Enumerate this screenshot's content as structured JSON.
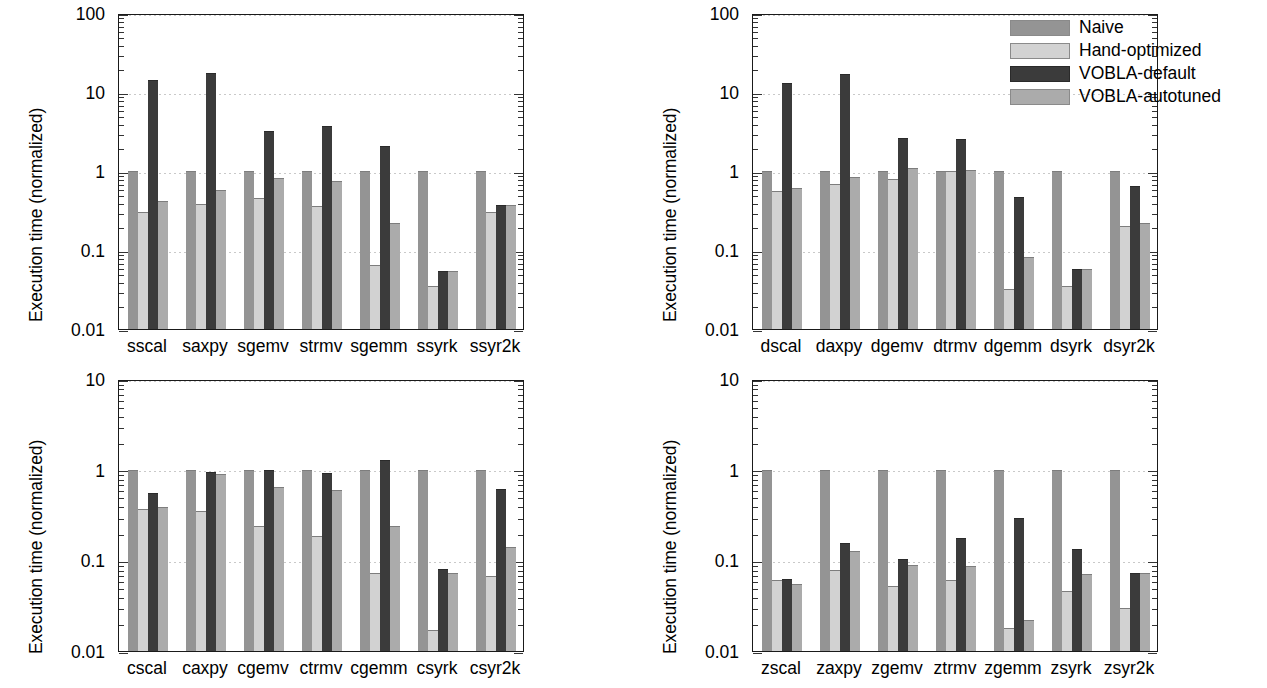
{
  "figure": {
    "axis_label": "Execution time (normalized)",
    "legend": [
      {
        "label": "Naive",
        "color": "#949494"
      },
      {
        "label": "Hand-optimized",
        "color": "#d2d2d2"
      },
      {
        "label": "VOBLA-default",
        "color": "#3b3b3b"
      },
      {
        "label": "VOBLA-autotuned",
        "color": "#ababab"
      }
    ],
    "series_names": [
      "Naive",
      "Hand-optimized",
      "VOBLA-default",
      "VOBLA-autotuned"
    ],
    "colors": {
      "naive": "#949494",
      "hand_optimized": "#d2d2d2",
      "vobla_default": "#3b3b3b",
      "vobla_autotuned": "#ababab",
      "axis": "#1a1a1a",
      "gridline": "#c9c9c9",
      "background": "#ffffff"
    }
  },
  "chart_data": [
    {
      "type": "bar",
      "panel": "top-left",
      "title": "",
      "xlabel": "",
      "ylabel": "Execution time (normalized)",
      "yscale": "log",
      "ylim": [
        0.01,
        100
      ],
      "yticks": [
        0.01,
        0.1,
        1,
        10,
        100
      ],
      "ytick_labels": [
        "0.01",
        "0.1",
        "1",
        "10",
        "100"
      ],
      "grid": true,
      "legend": false,
      "categories": [
        "sscal",
        "saxpy",
        "sgemv",
        "strmv",
        "sgemm",
        "ssyrk",
        "ssyr2k"
      ],
      "series": [
        {
          "name": "Naive",
          "values": [
            1.0,
            1.0,
            1.0,
            1.0,
            1.0,
            1.0,
            1.0
          ]
        },
        {
          "name": "Hand-optimized",
          "values": [
            0.3,
            0.38,
            0.45,
            0.36,
            0.065,
            0.035,
            0.3
          ]
        },
        {
          "name": "VOBLA-default",
          "values": [
            14.0,
            17.5,
            3.2,
            3.7,
            2.1,
            0.055,
            0.37
          ]
        },
        {
          "name": "VOBLA-autotuned",
          "values": [
            0.42,
            0.58,
            0.81,
            0.74,
            0.22,
            0.055,
            0.37
          ]
        }
      ]
    },
    {
      "type": "bar",
      "panel": "top-right",
      "title": "",
      "xlabel": "",
      "ylabel": "Execution time (normalized)",
      "yscale": "log",
      "ylim": [
        0.01,
        100
      ],
      "yticks": [
        0.01,
        0.1,
        1,
        10,
        100
      ],
      "ytick_labels": [
        "0.01",
        "0.1",
        "1",
        "10",
        "100"
      ],
      "grid": true,
      "legend": true,
      "legend_position": "top-right",
      "categories": [
        "dscal",
        "daxpy",
        "dgemv",
        "dtrmv",
        "dgemm",
        "dsyrk",
        "dsyr2k"
      ],
      "series": [
        {
          "name": "Naive",
          "values": [
            1.0,
            1.0,
            1.0,
            1.0,
            1.0,
            1.0,
            1.0
          ]
        },
        {
          "name": "Hand-optimized",
          "values": [
            0.56,
            0.68,
            0.8,
            0.99,
            0.032,
            0.035,
            0.2
          ]
        },
        {
          "name": "VOBLA-default",
          "values": [
            13.0,
            17.0,
            2.6,
            2.55,
            0.47,
            0.058,
            0.65
          ]
        },
        {
          "name": "VOBLA-autotuned",
          "values": [
            0.61,
            0.83,
            1.08,
            1.03,
            0.082,
            0.058,
            0.22
          ]
        }
      ]
    },
    {
      "type": "bar",
      "panel": "bottom-left",
      "title": "",
      "xlabel": "",
      "ylabel": "Execution time (normalized)",
      "yscale": "log",
      "ylim": [
        0.01,
        10
      ],
      "yticks": [
        0.01,
        0.1,
        1,
        10
      ],
      "ytick_labels": [
        "0.01",
        "0.1",
        "1",
        "10"
      ],
      "grid": true,
      "legend": false,
      "categories": [
        "cscal",
        "caxpy",
        "cgemv",
        "ctrmv",
        "cgemm",
        "csyrk",
        "csyr2k"
      ],
      "series": [
        {
          "name": "Naive",
          "values": [
            1.0,
            1.0,
            1.0,
            1.0,
            1.0,
            1.0,
            1.0
          ]
        },
        {
          "name": "Hand-optimized",
          "values": [
            0.37,
            0.35,
            0.24,
            0.185,
            0.073,
            0.017,
            0.068
          ]
        },
        {
          "name": "VOBLA-default",
          "values": [
            0.56,
            0.95,
            1.0,
            0.93,
            1.27,
            0.08,
            0.62
          ]
        },
        {
          "name": "VOBLA-autotuned",
          "values": [
            0.39,
            0.89,
            0.64,
            0.59,
            0.24,
            0.072,
            0.14
          ]
        }
      ]
    },
    {
      "type": "bar",
      "panel": "bottom-right",
      "title": "",
      "xlabel": "",
      "ylabel": "Execution time (normalized)",
      "yscale": "log",
      "ylim": [
        0.01,
        10
      ],
      "yticks": [
        0.01,
        0.1,
        1,
        10
      ],
      "ytick_labels": [
        "0.01",
        "0.1",
        "1",
        "10"
      ],
      "grid": true,
      "legend": false,
      "categories": [
        "zscal",
        "zaxpy",
        "zgemv",
        "ztrmv",
        "zgemm",
        "zsyrk",
        "zsyr2k"
      ],
      "series": [
        {
          "name": "Naive",
          "values": [
            1.0,
            1.0,
            1.0,
            1.0,
            1.0,
            1.0,
            1.0
          ]
        },
        {
          "name": "Hand-optimized",
          "values": [
            0.06,
            0.078,
            0.052,
            0.061,
            0.018,
            0.046,
            0.03
          ]
        },
        {
          "name": "VOBLA-default",
          "values": [
            0.063,
            0.155,
            0.104,
            0.175,
            0.29,
            0.132,
            0.073
          ]
        },
        {
          "name": "VOBLA-autotuned",
          "values": [
            0.055,
            0.128,
            0.089,
            0.087,
            0.022,
            0.07,
            0.073
          ]
        }
      ]
    }
  ]
}
